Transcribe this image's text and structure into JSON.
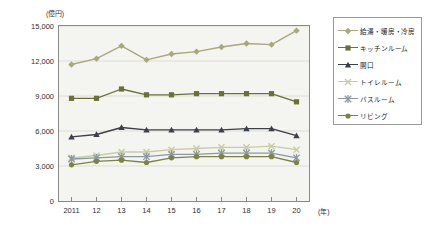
{
  "chart": {
    "type": "line",
    "y_unit": "(億円)",
    "x_unit": "(年)",
    "y_ticks": [
      "0",
      "3,000",
      "6,000",
      "9,000",
      "12,000",
      "15,000"
    ],
    "x_ticks": [
      "2011",
      "12",
      "13",
      "14",
      "15",
      "16",
      "17",
      "18",
      "19",
      "20"
    ]
  },
  "legend": {
    "items": [
      {
        "label": "給湯・暖房・冷房",
        "color": "#a8a878",
        "marker": "diamond"
      },
      {
        "label": "キッチンルーム",
        "color": "#6b7135",
        "marker": "square"
      },
      {
        "label": "開口",
        "color": "#3c3f4a",
        "marker": "triangle"
      },
      {
        "label": "トイレルーム",
        "color": "#c8cda0",
        "marker": "x"
      },
      {
        "label": "バスルーム",
        "color": "#8d96a4",
        "marker": "star"
      },
      {
        "label": "リビング",
        "color": "#7c8440",
        "marker": "circle"
      }
    ]
  },
  "chart_data": {
    "type": "line",
    "title": "",
    "xlabel": "(年)",
    "ylabel": "(億円)",
    "ylim": [
      0,
      15000
    ],
    "ytick_values": [
      0,
      3000,
      6000,
      9000,
      12000,
      15000
    ],
    "grid": true,
    "legend_position": "right",
    "categories": [
      "2011",
      "12",
      "13",
      "14",
      "15",
      "16",
      "17",
      "18",
      "19",
      "20"
    ],
    "series": [
      {
        "name": "給湯・暖房・冷房",
        "color": "#a8a878",
        "marker": "diamond",
        "values": [
          11700,
          12200,
          13300,
          12100,
          12600,
          12800,
          13200,
          13500,
          13400,
          14600
        ]
      },
      {
        "name": "キッチンルーム",
        "color": "#6b7135",
        "marker": "square",
        "values": [
          8800,
          8800,
          9600,
          9100,
          9100,
          9200,
          9200,
          9200,
          9200,
          8500
        ]
      },
      {
        "name": "開口",
        "color": "#3c3f4a",
        "marker": "triangle",
        "values": [
          5500,
          5700,
          6300,
          6100,
          6100,
          6100,
          6100,
          6200,
          6200,
          5600
        ]
      },
      {
        "name": "トイレルーム",
        "color": "#c8cda0",
        "marker": "x",
        "values": [
          3700,
          3900,
          4200,
          4200,
          4400,
          4500,
          4600,
          4600,
          4700,
          4400
        ]
      },
      {
        "name": "バスルーム",
        "color": "#8d96a4",
        "marker": "star",
        "values": [
          3600,
          3700,
          3800,
          3800,
          4000,
          4000,
          4100,
          4100,
          4100,
          3700
        ]
      },
      {
        "name": "リビング",
        "color": "#7c8440",
        "marker": "circle",
        "values": [
          3100,
          3400,
          3500,
          3300,
          3700,
          3800,
          3800,
          3800,
          3800,
          3300
        ]
      }
    ]
  }
}
